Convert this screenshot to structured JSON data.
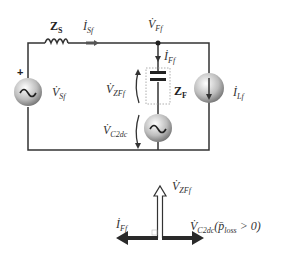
{
  "circuit": {
    "source_impedance": {
      "label": "Z",
      "sub": "S"
    },
    "source_current": {
      "label": "İ",
      "sub": "Sf"
    },
    "node_voltage": {
      "label": "V̇",
      "sub": "Ff"
    },
    "filter_current": {
      "label": "İ",
      "sub": "Ff"
    },
    "filter_impedance": {
      "label": "Z",
      "sub": "F"
    },
    "filter_impedance_voltage": {
      "label": "V̇",
      "sub": "ZFf"
    },
    "converter_voltage": {
      "label": "V̇",
      "sub": "C2dc"
    },
    "source_voltage": {
      "label": "V̇",
      "sub": "Sf"
    },
    "load_current": {
      "label": "İ",
      "sub": "Lf"
    },
    "polarity_mark": "+"
  },
  "phasor": {
    "up": {
      "label": "V̇",
      "sub": "ZFf"
    },
    "left": {
      "label": "İ",
      "sub": "Ff"
    },
    "right": {
      "label": "V̇",
      "sub": "C2dc",
      "condition": "(p̄",
      "cond_sub": "loss",
      "cond_tail": " > 0)"
    }
  },
  "colors": {
    "wire": "#333333",
    "arrow_dark": "#2a2a2a",
    "source_shade": "#888888"
  }
}
